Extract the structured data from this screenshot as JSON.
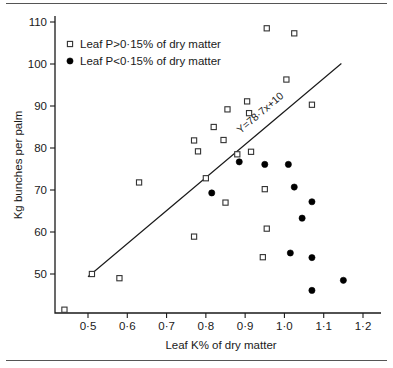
{
  "chart_data": {
    "type": "scatter",
    "title": "",
    "xlabel": "Leaf K% of dry matter",
    "ylabel": "Kg bunches per palm",
    "xlim": [
      0.42,
      1.23
    ],
    "ylim": [
      40,
      112
    ],
    "xticks": [
      0.5,
      0.6,
      0.7,
      0.8,
      0.9,
      1.0,
      1.1,
      1.2
    ],
    "xtick_labels": [
      "0·5",
      "0·6",
      "0·7",
      "0·8",
      "0·9",
      "1·0",
      "1·1",
      "1·2"
    ],
    "yticks": [
      50,
      60,
      70,
      80,
      90,
      100,
      110
    ],
    "ytick_labels": [
      "50",
      "60",
      "70",
      "80",
      "90",
      "100",
      "110"
    ],
    "grid": false,
    "legend_position": "top-left",
    "series": [
      {
        "name": "Leaf P>0·15% of dry matter",
        "marker": "open-square",
        "points": [
          [
            0.44,
            41.5
          ],
          [
            0.51,
            50.0
          ],
          [
            0.58,
            49.0
          ],
          [
            0.63,
            71.8
          ],
          [
            0.77,
            58.9
          ],
          [
            0.77,
            81.8
          ],
          [
            0.78,
            79.2
          ],
          [
            0.8,
            72.8
          ],
          [
            0.82,
            85.0
          ],
          [
            0.845,
            81.9
          ],
          [
            0.85,
            67.0
          ],
          [
            0.855,
            89.2
          ],
          [
            0.88,
            78.5
          ],
          [
            0.905,
            91.1
          ],
          [
            0.91,
            88.3
          ],
          [
            0.915,
            79.1
          ],
          [
            0.945,
            54.0
          ],
          [
            0.95,
            70.2
          ],
          [
            0.955,
            60.8
          ],
          [
            0.955,
            108.5
          ],
          [
            1.005,
            96.3
          ],
          [
            1.025,
            107.3
          ],
          [
            1.07,
            90.3
          ]
        ]
      },
      {
        "name": "Leaf P<0·15% of dry matter",
        "marker": "filled-circle",
        "points": [
          [
            0.815,
            69.3
          ],
          [
            0.885,
            76.7
          ],
          [
            0.95,
            76.1
          ],
          [
            1.01,
            76.1
          ],
          [
            1.025,
            70.7
          ],
          [
            1.015,
            55.0
          ],
          [
            1.045,
            63.3
          ],
          [
            1.07,
            67.2
          ],
          [
            1.07,
            53.9
          ],
          [
            1.07,
            46.1
          ],
          [
            1.15,
            48.5
          ]
        ]
      }
    ],
    "fit_line": {
      "label": "Y=78·7x+10",
      "slope": 78.7,
      "intercept": 10,
      "x_start": 0.5,
      "x_end": 1.145
    }
  },
  "legend": {
    "items": [
      {
        "label": "Leaf P>0·15% of dry matter",
        "marker": "open-square"
      },
      {
        "label": "Leaf P<0·15% of dry matter",
        "marker": "filled-circle"
      }
    ]
  }
}
